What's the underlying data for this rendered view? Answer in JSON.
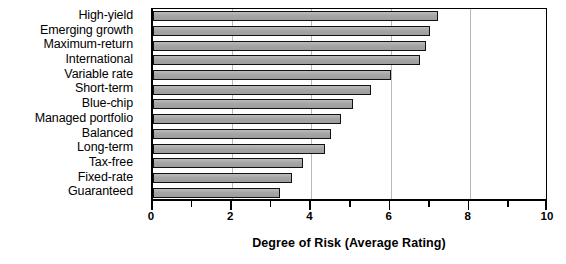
{
  "chart_data": {
    "type": "bar",
    "orientation": "horizontal",
    "title": "",
    "xlabel": "Degree of Risk (Average Rating)",
    "ylabel": "",
    "xlim": [
      0,
      10
    ],
    "xticks": [
      0,
      2,
      4,
      6,
      8,
      10
    ],
    "xticklabels": [
      "0",
      "2",
      "4",
      "6",
      "8",
      "10"
    ],
    "minor_xticks": [
      1,
      3,
      5,
      7,
      9
    ],
    "grid": "vertical-major",
    "legend": "none",
    "bar_color": "#a9a9a9",
    "bar_edge_color": "#111111",
    "categories": [
      "High-yield",
      "Emerging growth",
      "Maximum-return",
      "International",
      "Variable rate",
      "Short-term",
      "Blue-chip",
      "Managed portfolio",
      "Balanced",
      "Long-term",
      "Tax-free",
      "Fixed-rate",
      "Guaranteed"
    ],
    "values": [
      7.2,
      7.0,
      6.9,
      6.75,
      6.0,
      5.5,
      5.05,
      4.75,
      4.5,
      4.35,
      3.8,
      3.5,
      3.2
    ]
  }
}
